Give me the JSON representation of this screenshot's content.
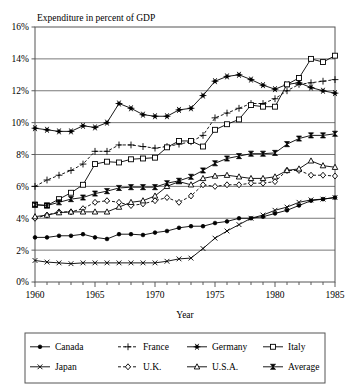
{
  "chart_data": {
    "type": "line",
    "title": "Expenditure in percent of GDP",
    "xlabel": "Year",
    "ylabel": "",
    "xlim": [
      1960,
      1985
    ],
    "ylim": [
      0,
      16
    ],
    "grid": true,
    "legend_position": "bottom",
    "y_ticks": [
      "0%",
      "2%",
      "4%",
      "6%",
      "8%",
      "10%",
      "12%",
      "14%",
      "16%"
    ],
    "y_tick_values": [
      0,
      2,
      4,
      6,
      8,
      10,
      12,
      14,
      16
    ],
    "x_ticks": [
      "1960",
      "1965",
      "1970",
      "1975",
      "1980",
      "1985"
    ],
    "x_tick_values": [
      1960,
      1965,
      1970,
      1975,
      1980,
      1985
    ],
    "x_minor_step": 1,
    "x": [
      1960,
      1961,
      1962,
      1963,
      1964,
      1965,
      1966,
      1967,
      1968,
      1969,
      1970,
      1971,
      1972,
      1973,
      1974,
      1975,
      1976,
      1977,
      1978,
      1979,
      1980,
      1981,
      1982,
      1983,
      1984,
      1985
    ],
    "series": [
      {
        "name": "Canada",
        "marker": "filled-circle",
        "line": "solid",
        "values": [
          2.8,
          2.8,
          2.9,
          2.9,
          3.0,
          2.8,
          2.7,
          3.0,
          3.0,
          2.95,
          3.1,
          3.2,
          3.4,
          3.5,
          3.5,
          3.7,
          3.8,
          4.0,
          4.0,
          4.1,
          4.3,
          4.5,
          4.8,
          5.1,
          5.2,
          5.3
        ]
      },
      {
        "name": "France",
        "marker": "plus",
        "line": "dashed",
        "values": [
          6.0,
          6.4,
          6.7,
          7.0,
          7.4,
          8.2,
          8.2,
          8.6,
          8.6,
          8.5,
          8.4,
          8.5,
          8.65,
          8.8,
          9.2,
          10.3,
          10.6,
          10.9,
          11.2,
          11.2,
          11.5,
          12.0,
          12.4,
          12.5,
          12.6,
          12.7
        ]
      },
      {
        "name": "Germany",
        "marker": "asterisk",
        "line": "solid",
        "values": [
          9.65,
          9.55,
          9.45,
          9.45,
          9.8,
          9.7,
          10.0,
          11.2,
          10.9,
          10.5,
          10.4,
          10.4,
          10.8,
          10.9,
          11.7,
          12.6,
          12.9,
          13.0,
          12.7,
          12.35,
          12.1,
          12.4,
          12.5,
          12.2,
          12.0,
          11.85
        ]
      },
      {
        "name": "Italy",
        "marker": "open-square",
        "line": "solid",
        "values": [
          4.85,
          4.8,
          5.2,
          5.6,
          6.1,
          7.4,
          7.55,
          7.5,
          7.7,
          7.75,
          7.8,
          8.45,
          8.85,
          8.85,
          8.5,
          9.55,
          9.9,
          10.2,
          11.1,
          11.0,
          11.0,
          12.4,
          12.8,
          14.0,
          13.8,
          14.2
        ]
      },
      {
        "name": "Japan",
        "marker": "cross-x",
        "line": "solid",
        "values": [
          1.35,
          1.25,
          1.2,
          1.15,
          1.2,
          1.2,
          1.2,
          1.2,
          1.2,
          1.2,
          1.2,
          1.3,
          1.45,
          1.5,
          2.1,
          2.75,
          3.2,
          3.6,
          4.0,
          4.2,
          4.5,
          4.7,
          5.0,
          5.15,
          5.2,
          5.3
        ]
      },
      {
        "name": "U.K.",
        "marker": "open-diamond",
        "line": "dashed",
        "values": [
          4.0,
          4.2,
          4.4,
          4.4,
          4.6,
          5.0,
          5.1,
          5.0,
          4.8,
          4.9,
          5.1,
          5.3,
          5.0,
          5.4,
          6.1,
          6.0,
          6.1,
          6.1,
          6.2,
          6.2,
          6.3,
          7.0,
          7.0,
          6.7,
          6.7,
          6.65
        ]
      },
      {
        "name": "U.S.A.",
        "marker": "open-triangle",
        "line": "solid",
        "values": [
          4.1,
          4.2,
          4.35,
          4.4,
          4.4,
          4.4,
          4.4,
          4.7,
          5.0,
          5.1,
          5.4,
          6.0,
          6.3,
          6.1,
          6.5,
          6.65,
          6.7,
          6.6,
          6.5,
          6.5,
          6.6,
          7.0,
          7.1,
          7.6,
          7.3,
          7.2
        ]
      },
      {
        "name": "Average",
        "marker": "bowtie",
        "line": "solid",
        "values": [
          4.85,
          4.8,
          5.0,
          5.2,
          5.3,
          5.55,
          5.7,
          5.9,
          5.95,
          5.95,
          5.95,
          6.2,
          6.35,
          6.6,
          7.0,
          7.45,
          7.75,
          7.9,
          8.05,
          8.05,
          8.1,
          8.65,
          9.0,
          9.2,
          9.2,
          9.3
        ]
      }
    ]
  },
  "legend": {
    "entries": [
      {
        "label": "Canada",
        "marker": "filled-circle",
        "line": "solid"
      },
      {
        "label": "France",
        "marker": "plus",
        "line": "dashed"
      },
      {
        "label": "Germany",
        "marker": "asterisk",
        "line": "solid"
      },
      {
        "label": "Italy",
        "marker": "open-square",
        "line": "solid"
      },
      {
        "label": "Japan",
        "marker": "cross-x",
        "line": "solid"
      },
      {
        "label": "U.K.",
        "marker": "open-diamond",
        "line": "dashed"
      },
      {
        "label": "U.S.A.",
        "marker": "open-triangle",
        "line": "solid"
      },
      {
        "label": "Average",
        "marker": "bowtie",
        "line": "solid"
      }
    ]
  },
  "colors": {
    "ink": "#000000",
    "frame": "#555555",
    "grid": "#555555",
    "background": "#ffffff"
  }
}
